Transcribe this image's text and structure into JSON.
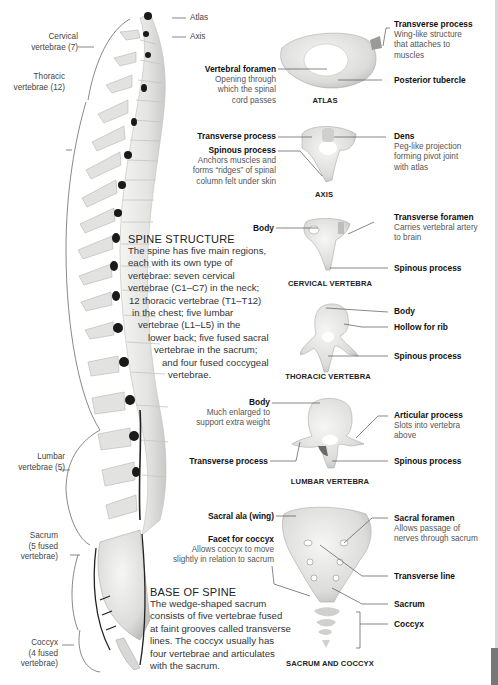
{
  "spine_regions": {
    "atlas": "Atlas",
    "axis": "Axis",
    "cervical": [
      "Cervical",
      "vertebrae (7)"
    ],
    "thoracic": [
      "Thoracic",
      "vertebrae (12)"
    ],
    "lumbar": [
      "Lumbar",
      "vertebrae (5)"
    ],
    "sacrum": [
      "Sacrum",
      "(5 fused",
      "vertebrae)"
    ],
    "coccyx": [
      "Coccyx",
      "(4 fused",
      "vertebrae)"
    ]
  },
  "spine_structure": {
    "title": "SPINE STRUCTURE",
    "lines": [
      "The spine has five main regions,",
      "each with its own type of",
      "vertebrae: seven cervical",
      "vertebrae (C1–C7) in the neck;",
      "12 thoracic vertebrae (T1–T12)",
      "in the chest; five lumbar",
      "vertebrae (L1–L5) in the",
      "lower back; five fused sacral",
      "vertebrae in the sacrum;",
      "and four fused coccygeal",
      "vertebrae."
    ]
  },
  "base_of_spine": {
    "title": "BASE OF SPINE",
    "lines": [
      "The wedge-shaped sacrum",
      "consists of five vertebrae fused",
      "at faint grooves called transverse",
      "lines. The coccyx usually has",
      "four vertebrae and articulates",
      "with the sacrum."
    ]
  },
  "atlas": {
    "caption": "ATLAS",
    "vertebral_foramen": {
      "title": "Vertebral foramen",
      "desc": [
        "Opening through",
        "which the spinal",
        "cord passes"
      ]
    },
    "transverse_process": {
      "title": "Transverse process",
      "desc": [
        "Wing-like structure",
        "that attaches to",
        "muscles"
      ]
    },
    "posterior_tubercle": {
      "title": "Posterior tubercle"
    }
  },
  "axis": {
    "caption": "AXIS",
    "transverse_process": {
      "title": "Transverse process"
    },
    "spinous_process": {
      "title": "Spinous process",
      "desc": [
        "Anchors muscles and",
        "forms “ridges” of spinal",
        "column felt under skin"
      ]
    },
    "dens": {
      "title": "Dens",
      "desc": [
        "Peg-like projection",
        "forming pivot joint",
        "with atlas"
      ]
    }
  },
  "cervical": {
    "caption": "CERVICAL VERTEBRA",
    "body": {
      "title": "Body"
    },
    "transverse_foramen": {
      "title": "Transverse foramen",
      "desc": [
        "Carries vertebral artery",
        "to brain"
      ]
    },
    "spinous_process": {
      "title": "Spinous process"
    }
  },
  "thoracic": {
    "caption": "THORACIC VERTEBRA",
    "body": {
      "title": "Body"
    },
    "hollow_for_rib": {
      "title": "Hollow for rib"
    },
    "spinous_process": {
      "title": "Spinous process"
    }
  },
  "lumbar": {
    "caption": "LUMBAR VERTEBRA",
    "body": {
      "title": "Body",
      "desc": [
        "Much enlarged to",
        "support extra weight"
      ]
    },
    "articular_process": {
      "title": "Articular process",
      "desc": [
        "Slots into vertebra",
        "above"
      ]
    },
    "transverse_process": {
      "title": "Transverse process"
    },
    "spinous_process": {
      "title": "Spinous process"
    }
  },
  "sacrum_coccyx": {
    "caption": "SACRUM AND COCCYX",
    "sacral_ala": {
      "title": "Sacral ala (wing)"
    },
    "facet_for_coccyx": {
      "title": "Facet for coccyx",
      "desc": [
        "Allows coccyx to move",
        "slightly in relation to sacrum"
      ]
    },
    "sacral_foramen": {
      "title": "Sacral foramen",
      "desc": [
        "Allows passage of",
        "nerves through sacrum"
      ]
    },
    "transverse_line": {
      "title": "Transverse line"
    },
    "sacrum": {
      "title": "Sacrum"
    },
    "coccyx": {
      "title": "Coccyx"
    }
  }
}
